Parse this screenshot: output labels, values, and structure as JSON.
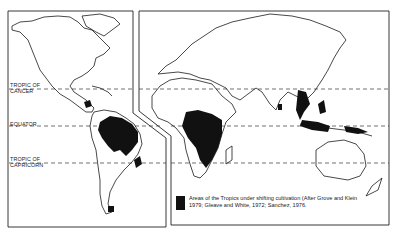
{
  "figure": {
    "type": "world-map",
    "panels": [
      "Americas",
      "Europe-Africa-Asia-Australia"
    ]
  },
  "latitude_lines": [
    {
      "id": "tropic-of-cancer",
      "label": "TROPIC OF\nCANCER",
      "y": 89
    },
    {
      "id": "equator",
      "label": "EQUATOR",
      "y": 126
    },
    {
      "id": "tropic-of-capricorn",
      "label": "TROPIC OF\nCAPRICORN",
      "y": 163
    }
  ],
  "legend": {
    "swatch_color": "#111111",
    "text": "Areas of the Tropics under shifting cultivation (After Grove and Klein 1979; Gleave and White, 1972; Sanchez, 1976."
  },
  "colors": {
    "background": "#ffffff",
    "outline": "#1a1a1a",
    "shifting_cultivation": "#111111"
  }
}
